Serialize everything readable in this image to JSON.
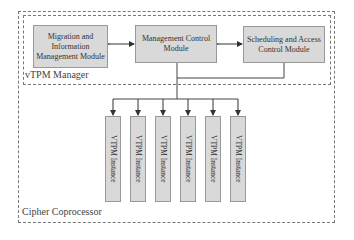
{
  "containers": {
    "outer_label": "Cipher Coprocessor",
    "inner_label": "vTPM Manager"
  },
  "modules": {
    "migration": "Migration and Information Management Module",
    "migration_lines": [
      "Migration and",
      "Information",
      "Management Module"
    ],
    "management": "Management Control Module",
    "management_lines": [
      "Management Control",
      "Module"
    ],
    "scheduling": "Scheduling and Access Control Module",
    "scheduling_lines": [
      "Scheduling and Access",
      "Control Module"
    ]
  },
  "instances": [
    {
      "label": "VTPM Instance"
    },
    {
      "label": "VTPM Instance"
    },
    {
      "label": "VTPM Instance"
    },
    {
      "label": "VTPM Instance"
    },
    {
      "label": "VTPM Instance"
    },
    {
      "label": "VTPM Instance"
    }
  ],
  "colors": {
    "box_fill": "#d9d9d9",
    "box_border": "#999999",
    "line": "#444444",
    "dash": "#777777"
  }
}
